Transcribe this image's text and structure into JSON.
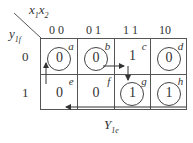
{
  "kmap": {
    "corner_col_var": "x",
    "corner_col_sub1": "1",
    "corner_col_var2": "x",
    "corner_col_sub2": "2",
    "corner_row_var": "y",
    "corner_row_sub": "1f",
    "col_labels": [
      "0 0",
      "0 1",
      "1 1",
      "10"
    ],
    "row_labels": [
      "0",
      "1"
    ],
    "cells": [
      {
        "label": "a",
        "value": "0",
        "circled": true
      },
      {
        "label": "b",
        "value": "0",
        "circled": true
      },
      {
        "label": "c",
        "value": "1",
        "circled": false
      },
      {
        "label": "d",
        "value": "0",
        "circled": true
      },
      {
        "label": "e",
        "value": "0",
        "circled": false
      },
      {
        "label": "f",
        "value": "0",
        "circled": false
      },
      {
        "label": "g",
        "value": "1",
        "circled": true
      },
      {
        "label": "h",
        "value": "1",
        "circled": true
      }
    ],
    "title_var": "Y",
    "title_sub": "1e"
  }
}
